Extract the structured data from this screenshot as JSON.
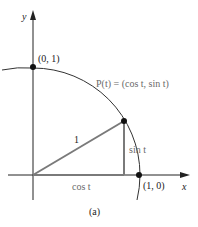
{
  "figure": {
    "caption": "(a)",
    "axes": {
      "x_label": "x",
      "y_label": "y"
    },
    "points": {
      "top": {
        "label": "(0, 1)"
      },
      "right": {
        "label": "(1, 0)"
      },
      "p": {
        "label": "P(t) = (cos t, sin t)"
      }
    },
    "triangle": {
      "hypotenuse_label": "1",
      "vertical_label": "sin t",
      "horizontal_label": "cos t"
    },
    "colors": {
      "axis": "#222222",
      "circle": "#333333",
      "triangle": "#7a7a7a",
      "label_gray": "#6a6a6a"
    }
  }
}
